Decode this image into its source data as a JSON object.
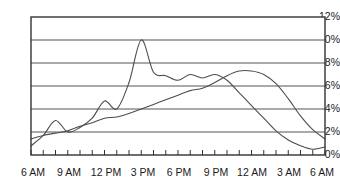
{
  "chart_data": {
    "type": "line",
    "title": "Violent crime",
    "xlabel": "",
    "ylabel": "",
    "ylim": [
      0,
      12
    ],
    "yticks": [
      "0%",
      "2%",
      "4%",
      "6%",
      "8%",
      "10%",
      "12%"
    ],
    "ytick_values": [
      0,
      2,
      4,
      6,
      8,
      10,
      12
    ],
    "grid": true,
    "legend_position": "inline-annotations",
    "x": [
      "6 AM",
      "7 AM",
      "8 AM",
      "9 AM",
      "10 AM",
      "11 AM",
      "12 PM",
      "1 PM",
      "2 PM",
      "3 PM",
      "4 PM",
      "5 PM",
      "6 PM",
      "7 PM",
      "8 PM",
      "9 PM",
      "10 PM",
      "11 PM",
      "12 AM",
      "1 AM",
      "2 AM",
      "3 AM",
      "4 AM",
      "5 AM",
      "6 AM"
    ],
    "xticks_labeled": [
      "6 AM",
      "9 AM",
      "12 PM",
      "3 PM",
      "6 PM",
      "9 PM",
      "12 AM",
      "3 AM",
      "6 AM"
    ],
    "xtick_label_positions": [
      0,
      3,
      6,
      9,
      12,
      15,
      18,
      21,
      24
    ],
    "series": [
      {
        "name": "Under age 18",
        "values": [
          0.8,
          1.7,
          3.0,
          2.0,
          2.4,
          3.2,
          4.7,
          4.0,
          6.3,
          10.0,
          7.2,
          6.9,
          6.5,
          7.0,
          6.7,
          7.0,
          6.5,
          5.4,
          4.3,
          3.2,
          2.1,
          1.3,
          0.8,
          0.5,
          0.7
        ]
      },
      {
        "name": "Age 18 and older",
        "values": [
          1.4,
          1.7,
          1.9,
          2.1,
          2.5,
          2.8,
          3.2,
          3.3,
          3.6,
          4.0,
          4.4,
          4.8,
          5.2,
          5.6,
          5.8,
          6.3,
          6.9,
          7.3,
          7.3,
          7.0,
          6.2,
          4.9,
          3.4,
          2.2,
          1.4
        ]
      }
    ],
    "annotations": [
      {
        "text": "Under age 18",
        "x_hint": 2.6,
        "y_hint": 8.7
      },
      {
        "text": "Age 18 and older",
        "x_hint": 8.7,
        "y_hint": 2.6
      }
    ],
    "colors": {
      "line": "#4d4d4d",
      "grid": "#555555",
      "border": "#333333",
      "text": "#1a1a1a",
      "background": "#ffffff"
    }
  }
}
